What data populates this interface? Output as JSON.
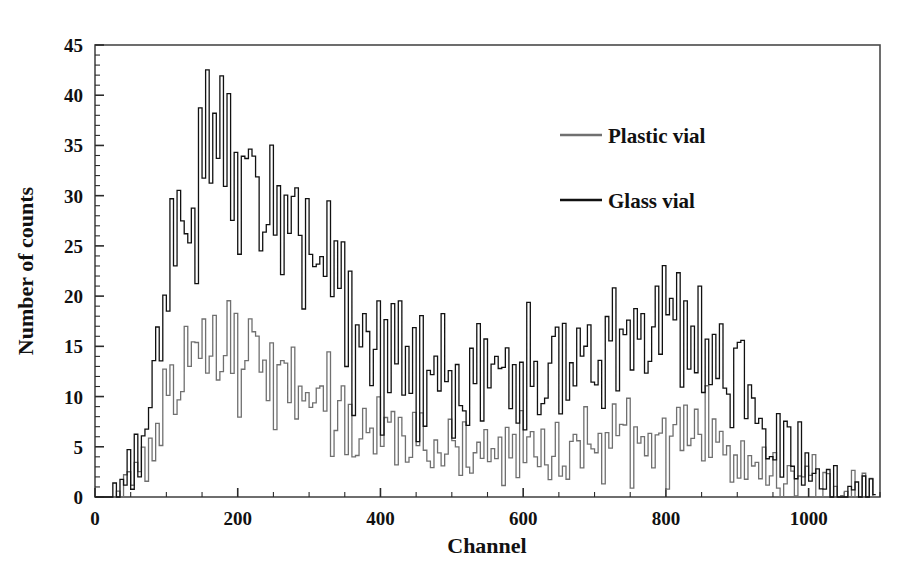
{
  "chart_data": {
    "type": "line",
    "title": "",
    "subtitle": "",
    "xlabel": "Channel",
    "ylabel": "Number of counts",
    "xlim": [
      0,
      1100
    ],
    "ylim": [
      0,
      45
    ],
    "xticks": [
      0,
      200,
      400,
      600,
      800,
      1000
    ],
    "yticks": [
      0,
      5,
      10,
      15,
      20,
      25,
      30,
      35,
      40,
      45
    ],
    "xtick_labels": [
      "0",
      "200",
      "400",
      "600",
      "800",
      "1000"
    ],
    "ytick_labels": [
      "0",
      "5",
      "10",
      "15",
      "20",
      "25",
      "30",
      "35",
      "40",
      "45"
    ],
    "x_minor_tick_step": 50,
    "y_minor_tick_step": 1,
    "grid": false,
    "legend_position": "upper right inside",
    "x_step": 5,
    "series": [
      {
        "name": "Plastic vial",
        "color": "#707070",
        "line_width": 1.3,
        "values": [
          0,
          0,
          0,
          0,
          0,
          0,
          1,
          0,
          1,
          2,
          1,
          3,
          2,
          4,
          3,
          6,
          5,
          8,
          7,
          10,
          9,
          12,
          10,
          13,
          11,
          14,
          12,
          15,
          13,
          16,
          14,
          17,
          13,
          18,
          15,
          16,
          12,
          17,
          14,
          15,
          11,
          16,
          13,
          14,
          12,
          15,
          11,
          13,
          12,
          14,
          10,
          13,
          11,
          12,
          9,
          13,
          10,
          12,
          8,
          11,
          9,
          12,
          7,
          10,
          8,
          11,
          6,
          9,
          7,
          10,
          6,
          9,
          5,
          8,
          6,
          9,
          5,
          7,
          6,
          8,
          4,
          7,
          5,
          8,
          4,
          6,
          5,
          7,
          3,
          6,
          4,
          7,
          3,
          5,
          4,
          6,
          3,
          5,
          4,
          6,
          3,
          5,
          2,
          6,
          4,
          5,
          3,
          7,
          4,
          6,
          3,
          5,
          4,
          7,
          3,
          6,
          4,
          5,
          2,
          6,
          3,
          7,
          4,
          5,
          3,
          6,
          2,
          5,
          4,
          7,
          3,
          5,
          2,
          6,
          4,
          5,
          3,
          7,
          5,
          6,
          4,
          7,
          3,
          6,
          5,
          8,
          4,
          6,
          5,
          7,
          3,
          6,
          4,
          8,
          5,
          7,
          4,
          6,
          5,
          8,
          4,
          7,
          6,
          8,
          5,
          7,
          4,
          8,
          6,
          7,
          5,
          8,
          4,
          6,
          5,
          7,
          3,
          6,
          4,
          5,
          3,
          6,
          2,
          5,
          3,
          4,
          2,
          5,
          3,
          4,
          2,
          3,
          1,
          4,
          2,
          3,
          1,
          2,
          1,
          3,
          1,
          2,
          0,
          1,
          1,
          2,
          0,
          1,
          0,
          1,
          1,
          0,
          1,
          0,
          0,
          1,
          0,
          1,
          0,
          0
        ]
      },
      {
        "name": "Glass vial",
        "color": "#111111",
        "line_width": 1.3,
        "values": [
          0,
          0,
          0,
          0,
          0,
          1,
          0,
          2,
          1,
          3,
          2,
          5,
          4,
          8,
          6,
          12,
          10,
          17,
          14,
          22,
          19,
          27,
          24,
          31,
          26,
          34,
          28,
          37,
          30,
          40,
          31,
          41,
          29,
          38,
          32,
          35,
          28,
          36,
          30,
          33,
          27,
          34,
          29,
          32,
          26,
          33,
          28,
          31,
          25,
          32,
          24,
          30,
          26,
          29,
          22,
          31,
          25,
          28,
          21,
          27,
          23,
          26,
          19,
          24,
          20,
          25,
          17,
          22,
          18,
          21,
          15,
          20,
          13,
          18,
          14,
          19,
          12,
          16,
          13,
          17,
          11,
          15,
          12,
          16,
          10,
          14,
          11,
          15,
          9,
          13,
          10,
          16,
          9,
          12,
          11,
          14,
          8,
          13,
          10,
          15,
          9,
          12,
          8,
          14,
          10,
          13,
          9,
          16,
          11,
          14,
          8,
          13,
          10,
          15,
          9,
          14,
          11,
          13,
          8,
          15,
          10,
          16,
          12,
          14,
          9,
          15,
          8,
          13,
          11,
          16,
          10,
          14,
          9,
          15,
          12,
          16,
          10,
          17,
          13,
          15,
          11,
          18,
          12,
          16,
          14,
          19,
          12,
          17,
          15,
          18,
          13,
          17,
          14,
          20,
          15,
          18,
          14,
          17,
          16,
          19,
          14,
          18,
          16,
          19,
          15,
          18,
          14,
          19,
          16,
          18,
          13,
          17,
          12,
          15,
          14,
          16,
          11,
          14,
          12,
          13,
          10,
          14,
          8,
          12,
          9,
          11,
          7,
          10,
          6,
          9,
          5,
          7,
          3,
          6,
          4,
          5,
          2,
          4,
          2,
          3,
          1,
          3,
          1,
          2,
          1,
          2,
          1,
          2,
          0,
          1,
          1,
          2,
          1,
          1,
          0,
          2,
          0,
          1,
          1,
          0
        ]
      }
    ],
    "notes": {
      "primary_peak_channel": 155,
      "primary_peak_value": 41,
      "secondary_bump_range": [
        480,
        680
      ],
      "secondary_bump_value": 20,
      "data_end_channel": 1020
    }
  },
  "legend": {
    "entries": [
      {
        "label": "Plastic vial",
        "color": "#707070"
      },
      {
        "label": "Glass vial",
        "color": "#111111"
      }
    ]
  },
  "axes": {
    "x_title": "Channel",
    "y_title": "Number of counts"
  }
}
